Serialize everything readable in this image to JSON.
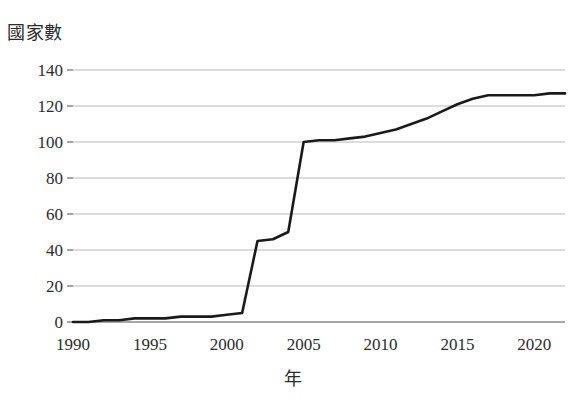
{
  "chart_data": {
    "type": "line",
    "title": "",
    "xlabel": "年",
    "ylabel": "國家數",
    "xlim": [
      1990,
      2022
    ],
    "ylim": [
      0,
      140
    ],
    "grid": true,
    "legend": null,
    "x_ticks": [
      1990,
      1995,
      2000,
      2005,
      2010,
      2015,
      2020
    ],
    "x_tick_labels": [
      "1990",
      "1995",
      "2000",
      "2005",
      "2010",
      "2015",
      "2020"
    ],
    "y_ticks": [
      0,
      20,
      40,
      60,
      80,
      100,
      120,
      140
    ],
    "y_tick_labels": [
      "0",
      "20",
      "40",
      "60",
      "80",
      "100",
      "120",
      "140"
    ],
    "line_color": "#1a1a1a",
    "grid_color": "#b9b9b9",
    "series": [
      {
        "name": "國家數",
        "x": [
          1990,
          1991,
          1992,
          1993,
          1994,
          1995,
          1996,
          1997,
          1998,
          1999,
          2000,
          2001,
          2002,
          2003,
          2004,
          2005,
          2006,
          2007,
          2008,
          2009,
          2010,
          2011,
          2012,
          2013,
          2014,
          2015,
          2016,
          2017,
          2018,
          2019,
          2020,
          2021,
          2022
        ],
        "values": [
          0,
          0,
          1,
          1,
          2,
          2,
          2,
          3,
          3,
          3,
          4,
          5,
          45,
          46,
          50,
          100,
          101,
          101,
          102,
          103,
          105,
          107,
          110,
          113,
          117,
          121,
          124,
          126,
          126,
          126,
          126,
          127,
          127
        ]
      }
    ]
  }
}
